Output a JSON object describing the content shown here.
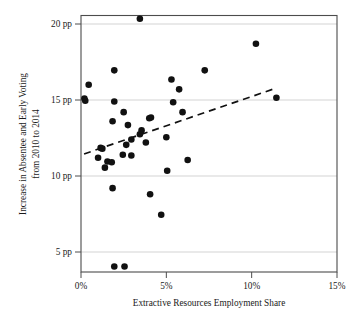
{
  "chart_data": {
    "type": "scatter",
    "title": "",
    "xlabel": "Extractive Resources Employment Share",
    "ylabel": "Increase in Absentee and Early Voting from 2010 to 2014",
    "ylabel_line1": "Increase in Absentee and Early Voting",
    "ylabel_line2": "from 2010 to 2014",
    "xlim": [
      0,
      15
    ],
    "ylim": [
      3.2,
      21.0
    ],
    "xticks": [
      0,
      5,
      10,
      15
    ],
    "xtick_labels": [
      "0%",
      "5%",
      "10%",
      "15%"
    ],
    "yticks": [
      5,
      10,
      15,
      20
    ],
    "ytick_labels": [
      "5 pp",
      "10 pp",
      "15 pp",
      "20 pp"
    ],
    "grid": "horizontal",
    "legend": "none",
    "point_color": "#111111",
    "gridline_color": "#c8c8c8",
    "frame_color": "#4c4c4c",
    "trendline_color": "#111111",
    "trendline_style": "dashed",
    "series": [
      {
        "name": "States",
        "points": [
          {
            "x": 3.45,
            "y": 20.35
          },
          {
            "x": 10.25,
            "y": 18.7
          },
          {
            "x": 1.95,
            "y": 16.95
          },
          {
            "x": 7.25,
            "y": 16.95
          },
          {
            "x": 5.3,
            "y": 16.35
          },
          {
            "x": 0.45,
            "y": 16.0
          },
          {
            "x": 5.75,
            "y": 15.7
          },
          {
            "x": 0.2,
            "y": 15.1
          },
          {
            "x": 0.25,
            "y": 14.95
          },
          {
            "x": 1.95,
            "y": 14.9
          },
          {
            "x": 5.4,
            "y": 14.85
          },
          {
            "x": 11.45,
            "y": 15.15
          },
          {
            "x": 2.5,
            "y": 14.2
          },
          {
            "x": 5.95,
            "y": 14.2
          },
          {
            "x": 1.85,
            "y": 13.6
          },
          {
            "x": 4.1,
            "y": 13.85
          },
          {
            "x": 4.0,
            "y": 13.8
          },
          {
            "x": 2.75,
            "y": 13.35
          },
          {
            "x": 3.55,
            "y": 13.0
          },
          {
            "x": 3.45,
            "y": 12.75
          },
          {
            "x": 5.0,
            "y": 12.55
          },
          {
            "x": 2.95,
            "y": 12.4
          },
          {
            "x": 3.8,
            "y": 12.2
          },
          {
            "x": 2.65,
            "y": 12.05
          },
          {
            "x": 1.15,
            "y": 11.85
          },
          {
            "x": 1.25,
            "y": 11.8
          },
          {
            "x": 1.0,
            "y": 11.2
          },
          {
            "x": 2.45,
            "y": 11.4
          },
          {
            "x": 2.95,
            "y": 11.35
          },
          {
            "x": 6.25,
            "y": 11.05
          },
          {
            "x": 1.55,
            "y": 10.95
          },
          {
            "x": 1.8,
            "y": 10.9
          },
          {
            "x": 1.4,
            "y": 10.55
          },
          {
            "x": 5.05,
            "y": 10.35
          },
          {
            "x": 1.85,
            "y": 9.2
          },
          {
            "x": 4.05,
            "y": 8.8
          },
          {
            "x": 4.7,
            "y": 7.45
          },
          {
            "x": 1.95,
            "y": 4.05
          },
          {
            "x": 2.55,
            "y": 4.05
          }
        ]
      }
    ],
    "trendline": {
      "x0": 0.18,
      "y0": 11.45,
      "x1": 11.35,
      "y1": 15.75
    }
  }
}
